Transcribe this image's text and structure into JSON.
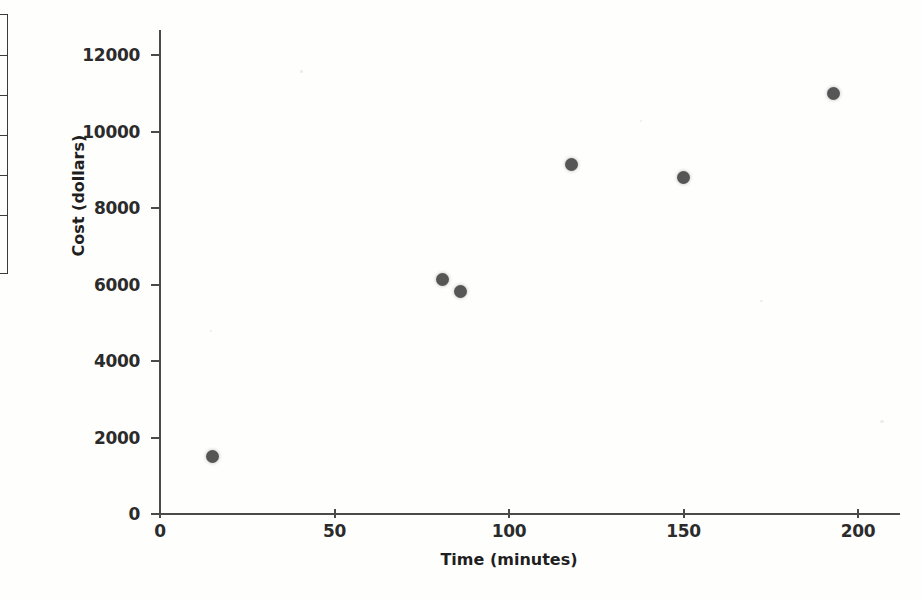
{
  "table_fragment": {
    "name": "clipped-table-left-edge",
    "row_count": 6
  },
  "chart_data": {
    "type": "scatter",
    "title": "",
    "xlabel": "Time (minutes)",
    "ylabel": "Cost (dollars)",
    "xlim": [
      0,
      200
    ],
    "ylim": [
      0,
      12000
    ],
    "grid": false,
    "legend": null,
    "xticks": [
      "0",
      "50",
      "100",
      "150",
      "200"
    ],
    "xtick_values": [
      0,
      50,
      100,
      150,
      200
    ],
    "yticks": [
      "0",
      "2000",
      "4000",
      "6000",
      "8000",
      "10000",
      "12000"
    ],
    "ytick_values": [
      0,
      2000,
      4000,
      6000,
      8000,
      10000,
      12000
    ],
    "marker_color": "#565656",
    "axis_color": "#4a4a4a",
    "points": [
      {
        "x": 15,
        "y": 1500
      },
      {
        "x": 81,
        "y": 6120
      },
      {
        "x": 86,
        "y": 5830
      },
      {
        "x": 118,
        "y": 9150
      },
      {
        "x": 150,
        "y": 8790
      },
      {
        "x": 193,
        "y": 11000
      }
    ]
  }
}
